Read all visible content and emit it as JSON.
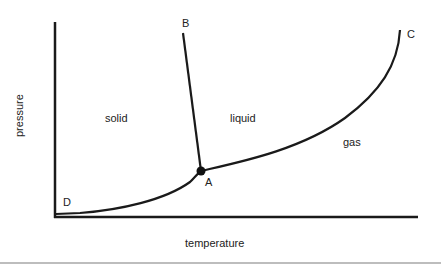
{
  "diagram": {
    "axes": {
      "x_label": "temperature",
      "y_label": "pressure"
    },
    "regions": [
      {
        "label": "solid",
        "x": 118,
        "y": 122
      },
      {
        "label": "liquid",
        "x": 245,
        "y": 122
      },
      {
        "label": "gas",
        "x": 352,
        "y": 146
      }
    ],
    "points": [
      {
        "label": "A",
        "x": 209,
        "y": 186,
        "note": "triple point"
      },
      {
        "label": "B",
        "x": 187,
        "y": 27
      },
      {
        "label": "C",
        "x": 411,
        "y": 37
      },
      {
        "label": "D",
        "x": 67,
        "y": 206
      }
    ],
    "colors": {
      "line": "#1a1a1a",
      "text": "#222222"
    }
  }
}
